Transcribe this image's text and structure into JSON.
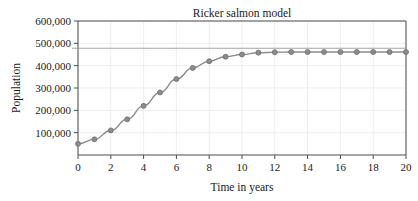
{
  "chart_data": {
    "type": "line",
    "title": "Ricker salmon model",
    "xlabel": "Time in years",
    "ylabel": "Population",
    "x": [
      0,
      1,
      2,
      3,
      4,
      5,
      6,
      7,
      8,
      9,
      10,
      11,
      12,
      13,
      14,
      15,
      16,
      17,
      18,
      19,
      20
    ],
    "values": [
      50000,
      70000,
      110000,
      160000,
      220000,
      280000,
      340000,
      390000,
      420000,
      440000,
      450000,
      458000,
      460000,
      461000,
      461000,
      461000,
      461000,
      461000,
      461000,
      461000,
      461000
    ],
    "series": [
      {
        "name": "Population",
        "values": [
          50000,
          70000,
          110000,
          160000,
          220000,
          280000,
          340000,
          390000,
          420000,
          440000,
          450000,
          458000,
          460000,
          461000,
          461000,
          461000,
          461000,
          461000,
          461000,
          461000,
          461000
        ]
      }
    ],
    "xticks": [
      0,
      2,
      4,
      6,
      8,
      10,
      12,
      14,
      16,
      18,
      20
    ],
    "xtick_labels": [
      "0",
      "2",
      "4",
      "6",
      "8",
      "10",
      "12",
      "14",
      "16",
      "18",
      "20"
    ],
    "yticks": [
      100000,
      200000,
      300000,
      400000,
      500000,
      600000
    ],
    "ytick_labels": [
      "100,000",
      "200,000",
      "300,000",
      "400,000",
      "500,000",
      "600,000"
    ],
    "xlim": [
      0,
      20
    ],
    "ylim": [
      0,
      600000
    ],
    "grid": true,
    "legend": "none",
    "reference_line": {
      "name": "carrying-capacity-line",
      "y": 478000,
      "color": "#999999"
    },
    "marker": {
      "shape": "circle",
      "color": "#8c8c8c",
      "edge_color": "#6e6e6e",
      "size": 5
    },
    "line_color": "#8c8c8c",
    "grid_color": "#e6e6e6",
    "axis_color": "#4d4d4d"
  }
}
